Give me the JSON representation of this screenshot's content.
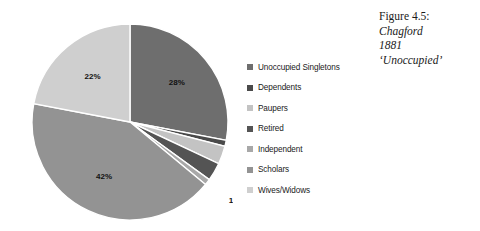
{
  "caption": {
    "figure_number": "Figure 4.5:",
    "place": "Chagford",
    "year": "1881",
    "subject": "‘Unoccupied’"
  },
  "legend": {
    "items": [
      {
        "label": "Unoccupied Singletons",
        "color": "#6e6e6e"
      },
      {
        "label": "Dependents",
        "color": "#4a4a4a"
      },
      {
        "label": "Paupers",
        "color": "#c3c3c3"
      },
      {
        "label": "Retired",
        "color": "#545454"
      },
      {
        "label": "Independent",
        "color": "#a8a8a8"
      },
      {
        "label": "Scholars",
        "color": "#939393"
      },
      {
        "label": "Wives/Widows",
        "color": "#cfcfcf"
      }
    ]
  },
  "chart_data": {
    "type": "pie",
    "title": "Chagford 1881 ‘Unoccupied’",
    "categories": [
      "Unoccupied Singletons",
      "Dependents",
      "Paupers",
      "Retired",
      "Independent",
      "Scholars",
      "Wives/Widows"
    ],
    "values": [
      28,
      1,
      3,
      3,
      1,
      42,
      22
    ],
    "value_unit": "percent",
    "data_labels": [
      "28%",
      "1%",
      "3%",
      "3%",
      "1%",
      "42%",
      "22%"
    ],
    "colors": [
      "#6e6e6e",
      "#4a4a4a",
      "#c3c3c3",
      "#545454",
      "#a8a8a8",
      "#939393",
      "#cfcfcf"
    ],
    "start_angle_deg": 0,
    "direction": "clockwise",
    "legend_position": "right",
    "grid": false,
    "border_color": "#ffffff"
  }
}
